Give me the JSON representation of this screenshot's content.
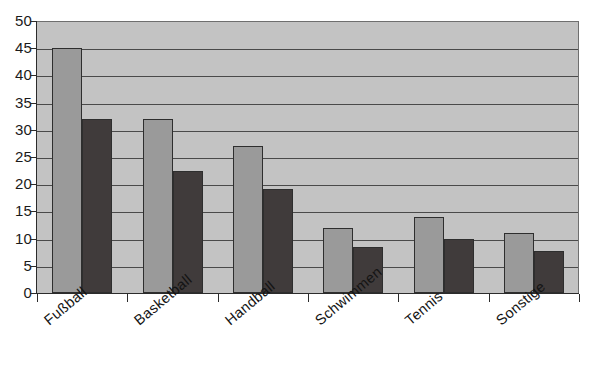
{
  "chart_data": {
    "type": "bar",
    "title": "",
    "subtitle": "",
    "xlabel": "",
    "ylabel": "",
    "categories": [
      "Fußball",
      "Basketball",
      "Handball",
      "Schwimmen",
      "Tennis",
      "Sonstige"
    ],
    "series": [
      {
        "name": "Reihe 1",
        "color": "#9a9a9a",
        "values": [
          45,
          32,
          27,
          12,
          14,
          11
        ]
      },
      {
        "name": "Reihe 2",
        "color": "#403b3b",
        "values": [
          32,
          22.5,
          19.2,
          8.5,
          10,
          7.8
        ]
      }
    ],
    "ylim": [
      0,
      50
    ],
    "ytick_step": 5,
    "yticks": [
      0,
      5,
      10,
      15,
      20,
      25,
      30,
      35,
      40,
      45,
      50
    ],
    "ytick_labels": [
      "0",
      "5",
      "10",
      "15",
      "20",
      "25",
      "30",
      "35",
      "40",
      "45",
      "50"
    ],
    "grid": "horizontal",
    "legend": "none",
    "plot_background": "#c3c3c3",
    "gridline_color": "#4a4a4a",
    "axis_color": "#2b2b2b",
    "label_rotation_deg": -40
  }
}
